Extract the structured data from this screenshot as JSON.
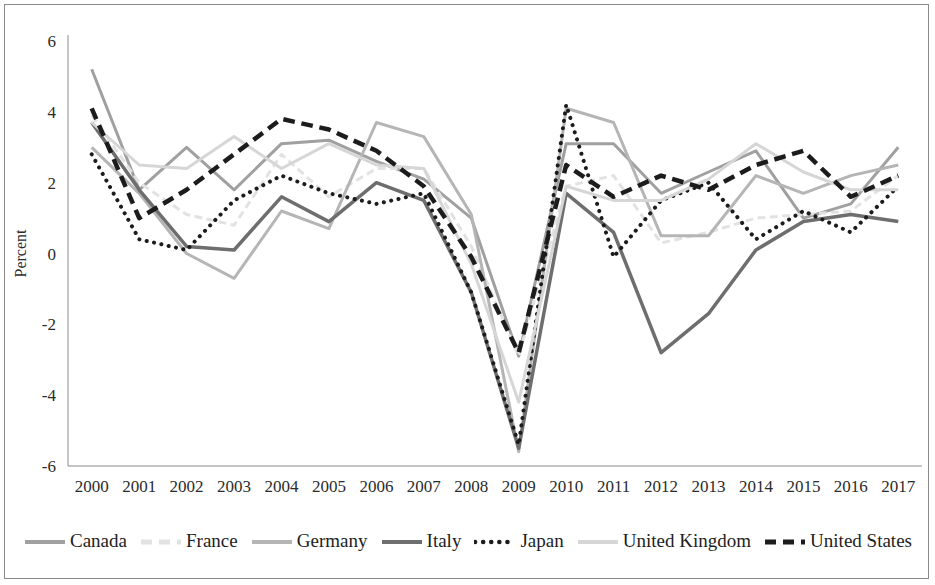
{
  "chart_data": {
    "type": "line",
    "title": "",
    "xlabel": "",
    "ylabel": "Percent",
    "x": [
      2000,
      2001,
      2002,
      2003,
      2004,
      2005,
      2006,
      2007,
      2008,
      2009,
      2010,
      2011,
      2012,
      2013,
      2014,
      2015,
      2016,
      2017
    ],
    "xtick_labels": [
      "2000",
      "2001",
      "2002",
      "2003",
      "2004",
      "2005",
      "2006",
      "2007",
      "2008",
      "2009",
      "2010",
      "2011",
      "2012",
      "2013",
      "2014",
      "2015",
      "2016",
      "2017"
    ],
    "ytick_labels": [
      "6",
      "4",
      "2",
      "0",
      "-2",
      "-4",
      "-6"
    ],
    "yticks": [
      6,
      4,
      2,
      0,
      -2,
      -4,
      -6
    ],
    "ylim": [
      -6,
      6
    ],
    "grid": false,
    "legend_position": "bottom",
    "series": [
      {
        "name": "Canada",
        "color": "#a0a0a0",
        "style": "solid",
        "width": 3,
        "values": [
          5.2,
          1.8,
          3.0,
          1.8,
          3.1,
          3.2,
          2.6,
          2.1,
          1.0,
          -2.9,
          3.1,
          3.1,
          1.7,
          2.3,
          2.9,
          1.0,
          1.4,
          3.0
        ]
      },
      {
        "name": "France",
        "color": "#e2e2e2",
        "style": "dashed",
        "width": 3,
        "values": [
          3.9,
          2.0,
          1.1,
          0.8,
          2.8,
          1.6,
          2.4,
          2.4,
          0.2,
          -2.9,
          1.9,
          2.2,
          0.3,
          0.6,
          1.0,
          1.1,
          1.2,
          2.2
        ]
      },
      {
        "name": "Germany",
        "color": "#b5b5b5",
        "style": "solid",
        "width": 3,
        "values": [
          3.0,
          1.7,
          0.0,
          -0.7,
          1.2,
          0.7,
          3.7,
          3.3,
          1.1,
          -5.6,
          4.1,
          3.7,
          0.5,
          0.5,
          2.2,
          1.7,
          2.2,
          2.5
        ]
      },
      {
        "name": "Italy",
        "color": "#6e6e6e",
        "style": "solid",
        "width": 3.5,
        "values": [
          3.7,
          1.8,
          0.2,
          0.1,
          1.6,
          0.9,
          2.0,
          1.5,
          -1.1,
          -5.5,
          1.7,
          0.6,
          -2.8,
          -1.7,
          0.1,
          0.9,
          1.1,
          0.9
        ]
      },
      {
        "name": "Japan",
        "color": "#1c1c1c",
        "style": "dotted",
        "width": 4,
        "values": [
          2.8,
          0.4,
          0.1,
          1.5,
          2.2,
          1.7,
          1.4,
          1.7,
          -1.1,
          -5.4,
          4.2,
          -0.1,
          1.5,
          2.0,
          0.4,
          1.2,
          0.6,
          1.9
        ]
      },
      {
        "name": "United Kingdom",
        "color": "#d6d6d6",
        "style": "solid",
        "width": 3,
        "values": [
          3.7,
          2.5,
          2.4,
          3.3,
          2.4,
          3.1,
          2.5,
          2.4,
          -0.3,
          -4.2,
          1.9,
          1.5,
          1.5,
          2.1,
          3.1,
          2.3,
          1.8,
          1.8
        ]
      },
      {
        "name": "United States",
        "color": "#1c1c1c",
        "style": "dashed",
        "width": 4.5,
        "values": [
          4.1,
          1.0,
          1.8,
          2.8,
          3.8,
          3.5,
          2.9,
          1.9,
          -0.1,
          -2.8,
          2.5,
          1.6,
          2.2,
          1.8,
          2.5,
          2.9,
          1.6,
          2.2
        ]
      }
    ]
  },
  "axis": {
    "y_title": "Percent"
  },
  "legend": {
    "items": [
      {
        "label": "Canada",
        "color": "#a0a0a0",
        "style": "solid"
      },
      {
        "label": "France",
        "color": "#e2e2e2",
        "style": "dashed"
      },
      {
        "label": "Germany",
        "color": "#b5b5b5",
        "style": "solid"
      },
      {
        "label": "Italy",
        "color": "#6e6e6e",
        "style": "solid"
      },
      {
        "label": "Japan",
        "color": "#1c1c1c",
        "style": "dotted"
      },
      {
        "label": "United Kingdom",
        "color": "#d6d6d6",
        "style": "solid"
      },
      {
        "label": "United States",
        "color": "#1c1c1c",
        "style": "dashed"
      }
    ]
  }
}
